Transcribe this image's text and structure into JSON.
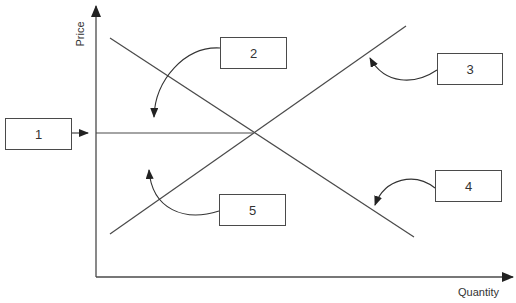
{
  "diagram": {
    "type": "supply-demand",
    "axes": {
      "y_label": "Price",
      "x_label": "Quantity"
    },
    "lines": [
      {
        "name": "demand",
        "from": [
          110,
          38
        ],
        "to": [
          414,
          237
        ]
      },
      {
        "name": "supply",
        "from": [
          110,
          234
        ],
        "to": [
          406,
          26
        ]
      },
      {
        "name": "equilibrium-price",
        "from": [
          96,
          133
        ],
        "to": [
          253,
          133
        ]
      }
    ],
    "equilibrium_point": [
      253,
      133
    ],
    "callouts": [
      {
        "id": "1",
        "label": "1",
        "box": [
          5,
          118,
          67,
          32
        ],
        "points_to": "equilibrium-price-level"
      },
      {
        "id": "2",
        "label": "2",
        "box": [
          220,
          37,
          67,
          32
        ],
        "points_to": "area-above-equilibrium"
      },
      {
        "id": "3",
        "label": "3",
        "box": [
          437,
          53,
          66,
          32
        ],
        "points_to": "supply-curve"
      },
      {
        "id": "4",
        "label": "4",
        "box": [
          435,
          170,
          67,
          32
        ],
        "points_to": "demand-curve"
      },
      {
        "id": "5",
        "label": "5",
        "box": [
          219,
          194,
          67,
          32
        ],
        "points_to": "area-below-equilibrium"
      }
    ],
    "colors": {
      "line": "#4a4a4a",
      "text": "#333333",
      "background": "#ffffff"
    }
  }
}
